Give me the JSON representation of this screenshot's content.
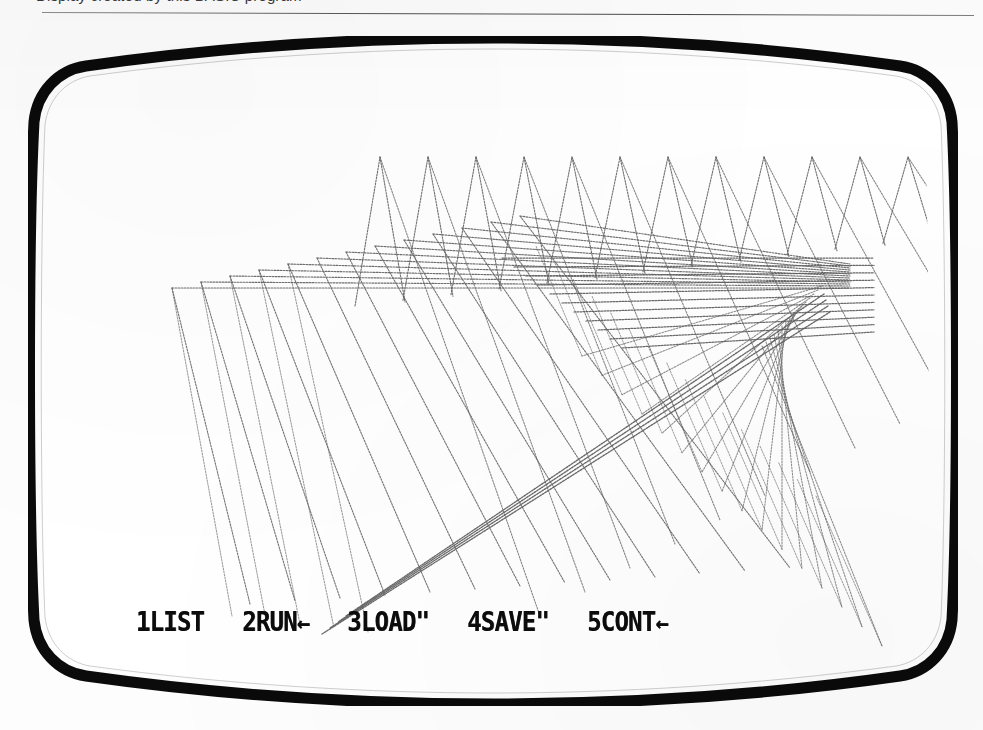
{
  "page": {
    "caption": "Display created by this BASIC program",
    "width": 983,
    "height": 730,
    "background_color": "#ffffff"
  },
  "crt": {
    "bezel_color": "#0b0b0b",
    "screen_color": "#ffffff",
    "label": "crt-monitor"
  },
  "screen": {
    "plot_color": "#5a5a5a",
    "function_keys": [
      {
        "key": "1",
        "label": "1LIST",
        "command": "LIST",
        "suffix": ""
      },
      {
        "key": "2",
        "label": "2RUN",
        "command": "RUN",
        "suffix": "←"
      },
      {
        "key": "3",
        "label": "3LOAD\"",
        "command": "LOAD\"",
        "suffix": ""
      },
      {
        "key": "4",
        "label": "4SAVE\"",
        "command": "SAVE\"",
        "suffix": ""
      },
      {
        "key": "5",
        "label": "5CONT",
        "command": "CONT",
        "suffix": "←"
      }
    ]
  },
  "chart_data": {
    "type": "line",
    "xlabel": "",
    "ylabel": "",
    "xlim": [
      0,
      894
    ],
    "ylim": [
      0,
      630
    ],
    "grid": false,
    "legend": false,
    "stroke_color": "#5a5a5a",
    "stroke_width": 1.15,
    "convergence_point": [
      786,
      168
    ],
    "series": [
      {
        "name": "zigzag-upper",
        "comment": "V peaks along the top of the figure",
        "peak_y": 101,
        "peak_spacing": 48,
        "peak_count": 14,
        "first_peak_x": 334
      },
      {
        "name": "horizontal-rays",
        "comment": "near-horizontal lines from left edge to the dense node",
        "count": 13,
        "left_x_start": 126,
        "left_x_step": 29,
        "left_y_start": 232,
        "left_y_step": -6
      },
      {
        "name": "descending-fan",
        "comment": "long diagonals sweeping down-left to the bottom apexes",
        "count": 13,
        "apex_y_bottom": 548
      }
    ]
  }
}
